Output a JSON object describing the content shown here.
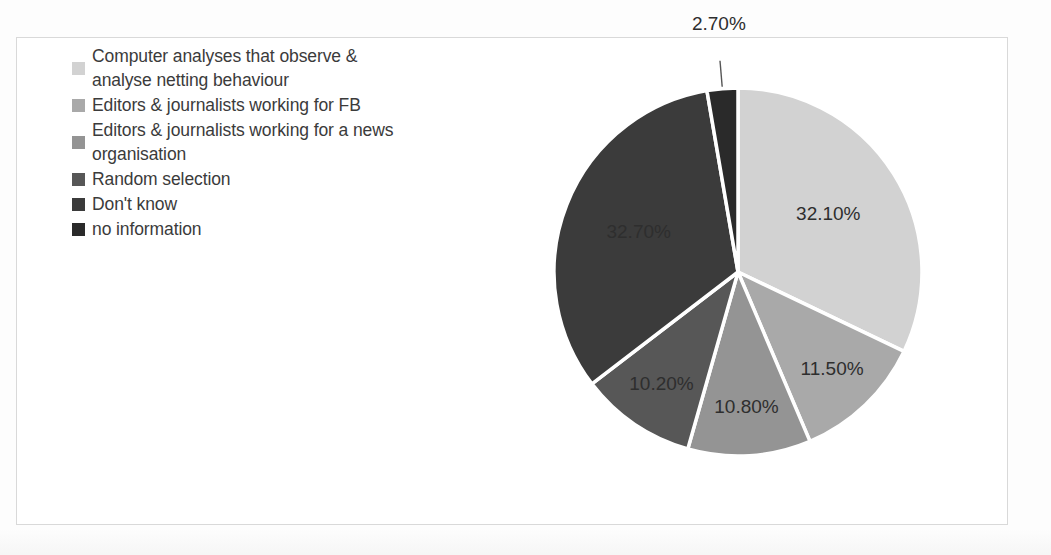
{
  "chart_data": {
    "type": "pie",
    "title": "",
    "subtitle": "",
    "xlabel": "",
    "ylabel": "",
    "legend_position": "left",
    "grid": false,
    "data_labels_format": "percent-2dp",
    "categories": [
      "Computer analyses that observe & analyse netting behaviour",
      "Editors & journalists working for FB",
      "Editors & journalists working for a news organisation",
      "Random selection",
      "Don't know",
      "no information"
    ],
    "values": [
      32.1,
      11.5,
      10.8,
      10.2,
      32.7,
      2.7
    ],
    "value_labels": [
      "32.10%",
      "11.50%",
      "10.80%",
      "10.20%",
      "32.70%",
      "2.70%"
    ],
    "colors": [
      "#d2d2d2",
      "#a9a9a9",
      "#949494",
      "#575757",
      "#3b3b3b",
      "#2a2a2a"
    ],
    "slices": [
      {
        "label": "Computer analyses that observe & analyse netting behaviour",
        "value": 32.1,
        "value_label": "32.10%",
        "color": "#d2d2d2",
        "label_placement": "inside"
      },
      {
        "label": "Editors & journalists working for FB",
        "value": 11.5,
        "value_label": "11.50%",
        "color": "#a9a9a9",
        "label_placement": "inside"
      },
      {
        "label": "Editors & journalists working for a news organisation",
        "value": 10.8,
        "value_label": "10.80%",
        "color": "#949494",
        "label_placement": "inside"
      },
      {
        "label": "Random selection",
        "value": 10.2,
        "value_label": "10.20%",
        "color": "#575757",
        "label_placement": "inside"
      },
      {
        "label": "Don't know",
        "value": 32.7,
        "value_label": "32.70%",
        "color": "#3b3b3b",
        "label_placement": "inside"
      },
      {
        "label": "no information",
        "value": 2.7,
        "value_label": "2.70%",
        "color": "#2a2a2a",
        "label_placement": "outside-with-leader"
      }
    ]
  },
  "legend": {
    "items": [
      {
        "label": "Computer analyses that observe & analyse netting behaviour",
        "color": "#d2d2d2"
      },
      {
        "label": "Editors & journalists working for FB",
        "color": "#a9a9a9"
      },
      {
        "label": "Editors & journalists working for a news organisation",
        "color": "#949494"
      },
      {
        "label": "Random selection",
        "color": "#575757"
      },
      {
        "label": "Don't know",
        "color": "#3b3b3b"
      },
      {
        "label": "no information",
        "color": "#2a2a2a"
      }
    ]
  },
  "labels": {
    "slice_1": "32.10%",
    "slice_2": "11.50%",
    "slice_3": "10.80%",
    "slice_4": "10.20%",
    "slice_5": "32.70%",
    "slice_6": "2.70%"
  }
}
